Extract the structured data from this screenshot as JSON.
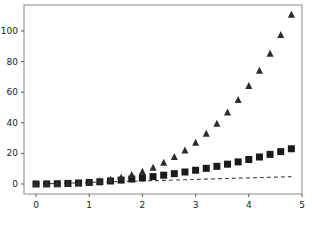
{
  "chart_data": {
    "type": "scatter",
    "title": "",
    "xlabel": "",
    "ylabel": "",
    "xlim": [
      -0.25,
      5.0
    ],
    "ylim": [
      -6,
      117
    ],
    "grid": false,
    "legend": null,
    "x": [
      0.0,
      0.2,
      0.4,
      0.6,
      0.8,
      1.0,
      1.2,
      1.4,
      1.6,
      1.8,
      2.0,
      2.2,
      2.4,
      2.6,
      2.8,
      3.0,
      3.2,
      3.4,
      3.6,
      3.8,
      4.0,
      4.2,
      4.4,
      4.6,
      4.8
    ],
    "series": [
      {
        "name": "t (linear)",
        "style": "dashed-line",
        "color": "#d62728",
        "values": [
          0.0,
          0.2,
          0.4,
          0.6,
          0.8,
          1.0,
          1.2,
          1.4,
          1.6,
          1.8,
          2.0,
          2.2,
          2.4,
          2.6,
          2.8,
          3.0,
          3.2,
          3.4,
          3.6,
          3.8,
          4.0,
          4.2,
          4.4,
          4.6,
          4.8
        ]
      },
      {
        "name": "t^2 (squares)",
        "style": "square-markers",
        "color": "#1f1f1f",
        "values": [
          0.0,
          0.04,
          0.16,
          0.36,
          0.64,
          1.0,
          1.44,
          1.96,
          2.56,
          3.24,
          4.0,
          4.84,
          5.76,
          6.76,
          7.84,
          9.0,
          10.24,
          11.56,
          12.96,
          14.44,
          16.0,
          17.64,
          19.36,
          21.16,
          23.04
        ]
      },
      {
        "name": "t^3 (triangles)",
        "style": "triangle-markers",
        "color": "#2a2a2a",
        "values": [
          0.0,
          0.008,
          0.064,
          0.216,
          0.512,
          1.0,
          1.728,
          2.744,
          4.096,
          5.832,
          8.0,
          10.648,
          13.824,
          17.576,
          21.952,
          27.0,
          32.768,
          39.304,
          46.656,
          54.872,
          64.0,
          74.088,
          85.184,
          97.336,
          110.592
        ]
      }
    ],
    "x_ticks": [
      "0",
      "1",
      "2",
      "3",
      "4",
      "5"
    ],
    "y_ticks": [
      "0",
      "20",
      "40",
      "60",
      "80",
      "100"
    ]
  }
}
